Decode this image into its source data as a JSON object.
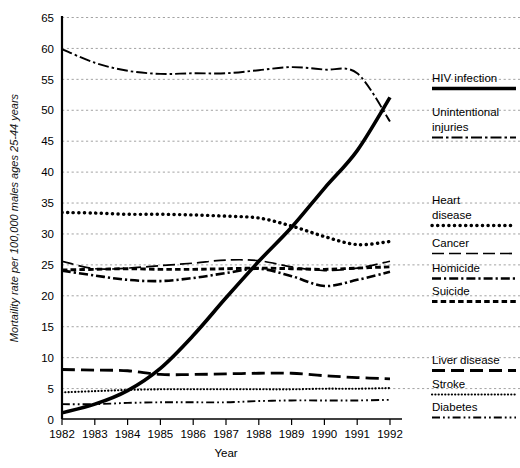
{
  "chart_data": {
    "type": "line",
    "title": "",
    "xlabel": "Year",
    "ylabel": "Mortaility rate per 100,000 males ages 25-44 years",
    "x": [
      1982,
      1983,
      1984,
      1985,
      1986,
      1987,
      1988,
      1989,
      1990,
      1991,
      1992
    ],
    "xtick_labels": [
      "1982",
      "1983",
      "1984",
      "1985",
      "1986",
      "1987",
      "1988",
      "1989",
      "1990",
      "1991",
      "1992"
    ],
    "ytick_labels": [
      "0",
      "5",
      "10",
      "15",
      "20",
      "25",
      "30",
      "35",
      "40",
      "45",
      "50",
      "55",
      "60",
      "65"
    ],
    "ylim": [
      0,
      65
    ],
    "xlim": [
      1982,
      1992
    ],
    "grid": true,
    "legend_position": "right",
    "series": [
      {
        "name": "HIV infection",
        "style": "solid-thick",
        "values": [
          1.0,
          2.4,
          4.6,
          8.2,
          13.5,
          19.6,
          25.5,
          31.0,
          37.3,
          43.4,
          52.0
        ]
      },
      {
        "name": "Unintentional injuries",
        "style": "dash-dot",
        "values": [
          59.8,
          57.6,
          56.3,
          55.8,
          55.9,
          55.9,
          56.4,
          56.9,
          56.5,
          55.9,
          48.1
        ]
      },
      {
        "name": "Heart disease",
        "style": "dotted-thick",
        "values": [
          33.4,
          33.3,
          33.1,
          33.1,
          33.0,
          32.8,
          32.5,
          31.2,
          29.5,
          28.2,
          28.7
        ]
      },
      {
        "name": "Cancer",
        "style": "long-dash",
        "values": [
          25.5,
          24.3,
          24.4,
          24.8,
          25.2,
          25.7,
          25.6,
          24.6,
          24.0,
          24.4,
          25.5
        ]
      },
      {
        "name": "Homicide",
        "style": "dash-dot-thick",
        "values": [
          24.0,
          23.2,
          22.5,
          22.3,
          22.8,
          23.6,
          24.3,
          23.1,
          21.5,
          22.5,
          23.8
        ]
      },
      {
        "name": "Suicide",
        "style": "short-dash-thick",
        "values": [
          24.1,
          24.2,
          24.3,
          24.2,
          24.2,
          24.3,
          24.4,
          24.3,
          24.2,
          24.4,
          24.6
        ]
      },
      {
        "name": "Liver disease",
        "style": "long-dash-thick",
        "values": [
          8.0,
          7.9,
          7.8,
          7.2,
          7.2,
          7.3,
          7.4,
          7.4,
          7.0,
          6.7,
          6.5
        ]
      },
      {
        "name": "Stroke",
        "style": "fine-dotted",
        "values": [
          4.3,
          4.5,
          4.7,
          4.8,
          4.8,
          4.8,
          4.8,
          4.8,
          4.9,
          4.9,
          5.0
        ]
      },
      {
        "name": "Diabetes",
        "style": "dash-dot-dot",
        "values": [
          2.4,
          2.4,
          2.6,
          2.7,
          2.7,
          2.7,
          2.9,
          3.0,
          3.0,
          3.0,
          3.1
        ]
      }
    ],
    "colors": {
      "ink": "#000000",
      "grid": "#999999",
      "axis": "#000000"
    }
  },
  "legend": {
    "items": [
      {
        "label": "HIV infection",
        "style": "solid-thick"
      },
      {
        "label": "Unintentional\ninjuries",
        "label_line1": "Unintentional",
        "label_line2": "injuries",
        "style": "dash-dot"
      },
      {
        "label": "Heart\ndisease",
        "label_line1": "Heart",
        "label_line2": "disease",
        "style": "dotted-thick"
      },
      {
        "label": "Cancer",
        "style": "long-dash"
      },
      {
        "label": "Homicide",
        "style": "dash-dot-thick"
      },
      {
        "label": "Suicide",
        "style": "short-dash-thick"
      },
      {
        "label": "Liver disease",
        "style": "long-dash-thick"
      },
      {
        "label": "Stroke",
        "style": "fine-dotted"
      },
      {
        "label": "Diabetes",
        "style": "dash-dot-dot"
      }
    ]
  }
}
